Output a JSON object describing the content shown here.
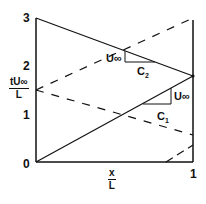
{
  "diagram": {
    "y_axis": {
      "label_numerator": "tU∞",
      "label_denominator": "L",
      "ticks": [
        "3",
        "2",
        "1",
        "0"
      ]
    },
    "x_axis": {
      "label_numerator": "x",
      "label_denominator": "L",
      "ticks": [
        "1"
      ]
    },
    "annotations": {
      "upper_slope_u": "U∞",
      "upper_slope_c": "C",
      "upper_slope_c_sub": "2",
      "lower_slope_u": "U∞",
      "lower_slope_c": "C",
      "lower_slope_c_sub": "1"
    },
    "lines": {
      "solid_descending": {
        "from": [
          0,
          3.0
        ],
        "to": [
          1,
          1.8
        ],
        "style": "solid"
      },
      "solid_ascending": {
        "from": [
          0,
          0.0
        ],
        "to": [
          1,
          1.8
        ],
        "style": "solid"
      },
      "dashed_ascending": {
        "from": [
          0,
          1.5
        ],
        "to": [
          1,
          3.0
        ],
        "style": "dashed"
      },
      "dashed_descending": {
        "from": [
          0,
          1.5
        ],
        "to": [
          1,
          0.56
        ],
        "style": "dashed"
      },
      "dashed_corner": {
        "from": [
          0.83,
          0.0
        ],
        "to": [
          1,
          0.35
        ],
        "style": "dashed"
      }
    },
    "colors": {
      "ink": "#111111",
      "background": "#ffffff"
    }
  }
}
